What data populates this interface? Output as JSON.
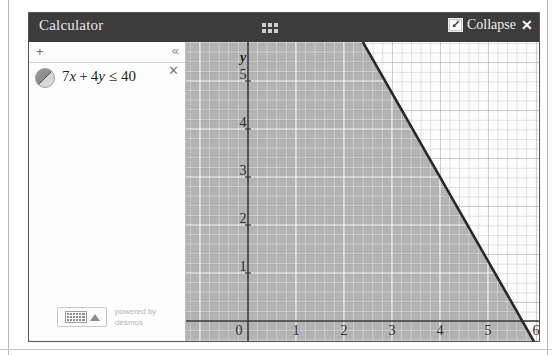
{
  "window": {
    "title": "Calculator",
    "drag_handle_icon": "grid-dots-icon",
    "collapse_icon": "collapse-arrow-icon",
    "collapse_label": "Collapse",
    "close_label": "✕",
    "header_bg": "#3c3c3c",
    "header_text_color": "#e8e8e8"
  },
  "expression_panel": {
    "add_label": "+",
    "collapse_panel_label": "«",
    "expression": {
      "swatch_icon": "inequality-shade-swatch-icon",
      "text_full": "7x + 4y ≤ 40",
      "coef_x": "7",
      "var_x": "x",
      "plus": "+",
      "coef_y": "4",
      "var_y": "y",
      "relation": "≤",
      "rhs": "40",
      "delete_label": "✕"
    },
    "footer": {
      "keypad_icon": "keyboard-icon",
      "graph_icon": "graph-toggle-icon",
      "powered_line1": "powered by",
      "powered_line2": "desmos"
    }
  },
  "graph": {
    "x_axis_label": "",
    "y_axis_label": "y",
    "x_ticks": [
      "0",
      "1",
      "2",
      "3",
      "4",
      "5",
      "6"
    ],
    "y_ticks": [
      "1",
      "2",
      "3",
      "4",
      "5"
    ],
    "origin_label": "0",
    "shade_color": "#b4b4b4",
    "boundary_color": "#2a2a2a",
    "grid_color": "#ffffff",
    "axis_color": "#333333"
  },
  "chart_data": {
    "type": "line",
    "xlabel": "x",
    "ylabel": "y",
    "xlim": [
      -1.3,
      6.1
    ],
    "ylim": [
      -0.35,
      5.6
    ],
    "grid": true,
    "legend": "none",
    "series": [
      {
        "name": "7x + 4y = 40",
        "type": "line",
        "x": [
          2.514,
          5.714
        ],
        "y": [
          5.6,
          0.0
        ],
        "slope": -1.75,
        "intercept": 10,
        "style": "solid",
        "color": "#2a2a2a"
      }
    ],
    "regions": [
      {
        "name": "7x + 4y ≤ 40",
        "fill": "#b4b4b4",
        "side": "below-left",
        "annotation": "shaded half-plane satisfying 7x + 4y ≤ 40"
      }
    ],
    "x_tick_values": [
      0,
      1,
      2,
      3,
      4,
      5,
      6
    ],
    "y_tick_values": [
      0,
      1,
      2,
      3,
      4,
      5
    ]
  }
}
